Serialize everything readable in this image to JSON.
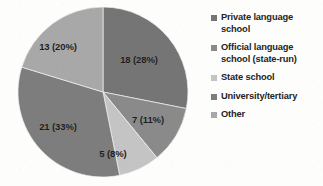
{
  "chart_data": {
    "type": "pie",
    "title": "",
    "subtitle": "",
    "xlabel": "",
    "ylabel": "",
    "grid": false,
    "legend_position": "right",
    "total": 64,
    "value_label_format": "{value} ({percent}%)",
    "categories": [
      "Private language school",
      "Official language school (state-run)",
      "State school",
      "University/tertiary",
      "Other"
    ],
    "values": [
      18,
      7,
      5,
      21,
      13
    ],
    "percents": [
      28,
      11,
      8,
      33,
      20
    ],
    "colors": [
      "#757575",
      "#8a8a8a",
      "#c4c4c4",
      "#7d7d7d",
      "#a8a8a8"
    ],
    "slices": [
      {
        "label": "Private language school",
        "value": 18,
        "percent": 28,
        "data_label": "18 (28%)",
        "color": "#757575",
        "start_angle": 0,
        "end_angle": 101.25,
        "label_x": 139,
        "label_y": 60
      },
      {
        "label": "Official language school (state-run)",
        "value": 7,
        "percent": 11,
        "data_label": "7 (11%)",
        "color": "#8a8a8a",
        "start_angle": 101.25,
        "end_angle": 140.625,
        "label_x": 148,
        "label_y": 120
      },
      {
        "label": "State school",
        "value": 5,
        "percent": 8,
        "data_label": "5 (8%)",
        "color": "#c4c4c4",
        "start_angle": 140.625,
        "end_angle": 168.75,
        "label_x": 113,
        "label_y": 154
      },
      {
        "label": "University/tertiary",
        "value": 21,
        "percent": 33,
        "data_label": "21 (33%)",
        "color": "#7d7d7d",
        "start_angle": 168.75,
        "end_angle": 287.0,
        "label_x": 58,
        "label_y": 127
      },
      {
        "label": "Other",
        "value": 13,
        "percent": 20,
        "data_label": "13 (20%)",
        "color": "#a8a8a8",
        "start_angle": 287.0,
        "end_angle": 360,
        "label_x": 58,
        "label_y": 47
      }
    ],
    "geometry": {
      "center_x": 103,
      "center_y": 92,
      "radius": 85
    }
  },
  "legend": {
    "items": [
      {
        "label": "Private language school",
        "color": "#757575",
        "swatch_icon": "legend-swatch-square"
      },
      {
        "label": "Official language school (state-run)",
        "color": "#8a8a8a",
        "swatch_icon": "legend-swatch-square"
      },
      {
        "label": "State school",
        "color": "#c4c4c4",
        "swatch_icon": "legend-swatch-square"
      },
      {
        "label": "University/tertiary",
        "color": "#7d7d7d",
        "swatch_icon": "legend-swatch-square"
      },
      {
        "label": "Other",
        "color": "#a8a8a8",
        "swatch_icon": "legend-swatch-square"
      }
    ]
  }
}
